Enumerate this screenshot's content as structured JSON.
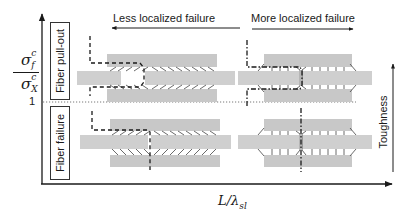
{
  "figure": {
    "y_axis_label": {
      "numerator": "σ",
      "numerator_sub": "f",
      "numerator_sup": "c",
      "denominator": "σ",
      "denominator_sub": "X",
      "denominator_sup": "c"
    },
    "y_tick": "1",
    "x_axis_label": "L/λsl",
    "x_axis_label_main": "L/λ",
    "x_axis_label_sub": "sl",
    "regions": [
      {
        "label": "Fiber pull-out",
        "position": "above threshold"
      },
      {
        "label": "Fiber failure",
        "position": "below threshold"
      }
    ],
    "arrows": {
      "less_localized": "Less localized failure",
      "more_localized": "More localized failure",
      "toughness": "Toughness"
    },
    "schematics": [
      {
        "name": "pull-out-less-localized",
        "crack": "stepped dashed",
        "bridges": "slanted"
      },
      {
        "name": "pull-out-more-localized",
        "crack": "stepped dash-dot",
        "bridges": "vertical"
      },
      {
        "name": "failure-less-localized",
        "crack": "stepped dashed",
        "bridges": "slanted"
      },
      {
        "name": "failure-more-localized",
        "crack": "straight dash-dot",
        "bridges": "vertical"
      }
    ],
    "colors": {
      "axis": "#1a1a1a",
      "matrix": "#c8c8c8",
      "fiber": "#cfcfcf",
      "crack": "#1a1a1a",
      "threshold_line": "#555555"
    }
  }
}
